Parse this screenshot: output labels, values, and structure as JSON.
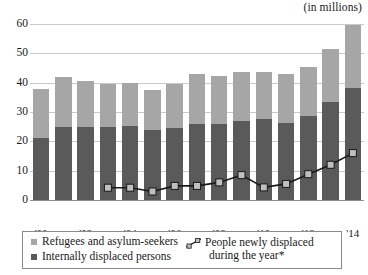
{
  "units_note": "(in millions)",
  "legend": {
    "refugees_label": "Refugees and asylum-seekers",
    "idp_label": "Internally displaced persons",
    "line_label_line1": "People newly displaced",
    "line_label_line2": "during the year*",
    "line_icon_name": "line-series-icon"
  },
  "colors": {
    "refugees": "#a6a6a6",
    "idp": "#5a5a5a",
    "line": "#1a1a1a",
    "marker_fill": "#bfbfbf",
    "grid": "#c9c9c9"
  },
  "chart_data": {
    "type": "bar",
    "title": "",
    "subtitle": "",
    "xlabel": "",
    "ylabel": "",
    "annotations": [
      "(in millions)"
    ],
    "ylim": [
      0,
      60
    ],
    "yticks": [
      0,
      10,
      20,
      30,
      40,
      50,
      60
    ],
    "ytick_labels": [
      "0",
      "10",
      "20",
      "30",
      "40",
      "50",
      "60"
    ],
    "grid": true,
    "legend_position": "bottom",
    "x": [
      2000,
      2001,
      2002,
      2003,
      2004,
      2005,
      2006,
      2007,
      2008,
      2009,
      2010,
      2011,
      2012,
      2013,
      2014
    ],
    "categories": [
      "'00",
      "'01",
      "'02",
      "'03",
      "'04",
      "'05",
      "'06",
      "'07",
      "'08",
      "'09",
      "'10",
      "'11",
      "'12",
      "'13",
      "'14"
    ],
    "xtick_labels_shown": [
      "'00",
      "'02",
      "'04",
      "'06",
      "'08",
      "'10",
      "'12",
      "'14"
    ],
    "stacked": true,
    "series": [
      {
        "name": "Internally displaced persons",
        "type": "bar",
        "stack": "total",
        "color": "#5a5a5a",
        "values": [
          21.0,
          25.0,
          25.0,
          24.8,
          25.3,
          23.7,
          24.4,
          26.0,
          26.0,
          27.1,
          27.5,
          26.4,
          28.8,
          33.3,
          38.2
        ]
      },
      {
        "name": "Refugees and asylum-seekers",
        "type": "bar",
        "stack": "total",
        "color": "#a6a6a6",
        "values": [
          17.0,
          17.0,
          15.7,
          14.6,
          14.7,
          13.8,
          15.2,
          16.9,
          16.2,
          16.4,
          16.1,
          16.5,
          16.6,
          18.3,
          21.5
        ]
      },
      {
        "name": "People newly displaced during the year*",
        "type": "line",
        "color": "#1a1a1a",
        "marker": "square",
        "values": [
          null,
          null,
          null,
          4.2,
          4.2,
          2.9,
          4.8,
          4.8,
          6.0,
          8.5,
          4.3,
          5.5,
          8.8,
          12.0,
          16.0
        ]
      }
    ],
    "totals": [
      38.0,
      42.0,
      40.7,
      39.4,
      40.0,
      37.5,
      39.6,
      42.9,
      42.2,
      43.5,
      43.6,
      42.9,
      45.4,
      51.6,
      59.7
    ]
  }
}
